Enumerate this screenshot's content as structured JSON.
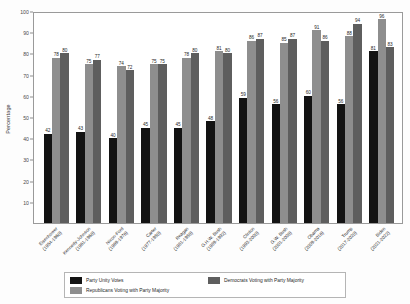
{
  "chart_data": {
    "type": "bar",
    "title": "",
    "xlabel": "",
    "ylabel": "Percentage",
    "ylim": [
      0,
      100
    ],
    "yticks": [
      10,
      20,
      30,
      40,
      50,
      60,
      70,
      80,
      90,
      100
    ],
    "grid": false,
    "legend_position": "bottom",
    "categories": [
      "Eisenhower (1954-1960)",
      "Kennedy-Johnson (1961-1968)",
      "Nixon-Ford (1969-1976)",
      "Carter (1977-1980)",
      "Reagan (1981-1988)",
      "G.H.W. Bush (1989-1992)",
      "Clinton (1993-2000)",
      "G.W. Bush (2001-2008)",
      "Obama (2009-2016)",
      "Trump (2017-2020)",
      "Biden (2021-2022)"
    ],
    "category_lines": [
      [
        "Eisenhower",
        "(1954-1960)"
      ],
      [
        "Kennedy-Johnson",
        "(1961-1968)"
      ],
      [
        "Nixon-Ford",
        "(1969-1976)"
      ],
      [
        "Carter",
        "(1977-1980)"
      ],
      [
        "Reagan",
        "(1981-1988)"
      ],
      [
        "G.H.W. Bush",
        "(1989-1992)"
      ],
      [
        "Clinton",
        "(1993-2000)"
      ],
      [
        "G.W. Bush",
        "(2001-2008)"
      ],
      [
        "Obama",
        "(2009-2016)"
      ],
      [
        "Trump",
        "(2017-2020)"
      ],
      [
        "Biden",
        "(2021-2022)"
      ]
    ],
    "series": [
      {
        "name": "Party Unity Votes",
        "color": "#131313",
        "values": [
          42,
          43,
          40,
          45,
          45,
          48,
          59,
          56,
          60,
          56,
          81
        ]
      },
      {
        "name": "Republicans Voting with Party Majority",
        "color": "#8e8e8e",
        "values": [
          78,
          75,
          74,
          75,
          78,
          81,
          86,
          85,
          91,
          88,
          96
        ]
      },
      {
        "name": "Democrats Voting with Party Majority",
        "color": "#5e5e5e",
        "values": [
          80,
          77,
          72,
          75,
          80,
          80,
          87,
          87,
          86,
          94,
          83
        ]
      }
    ]
  },
  "legend": {
    "items": [
      {
        "label": "Party Unity Votes",
        "color": "#131313"
      },
      {
        "label": "Republicans Voting with Party Majority",
        "color": "#8e8e8e"
      },
      {
        "label": "Democrats Voting with Party Majority",
        "color": "#5e5e5e"
      }
    ]
  }
}
